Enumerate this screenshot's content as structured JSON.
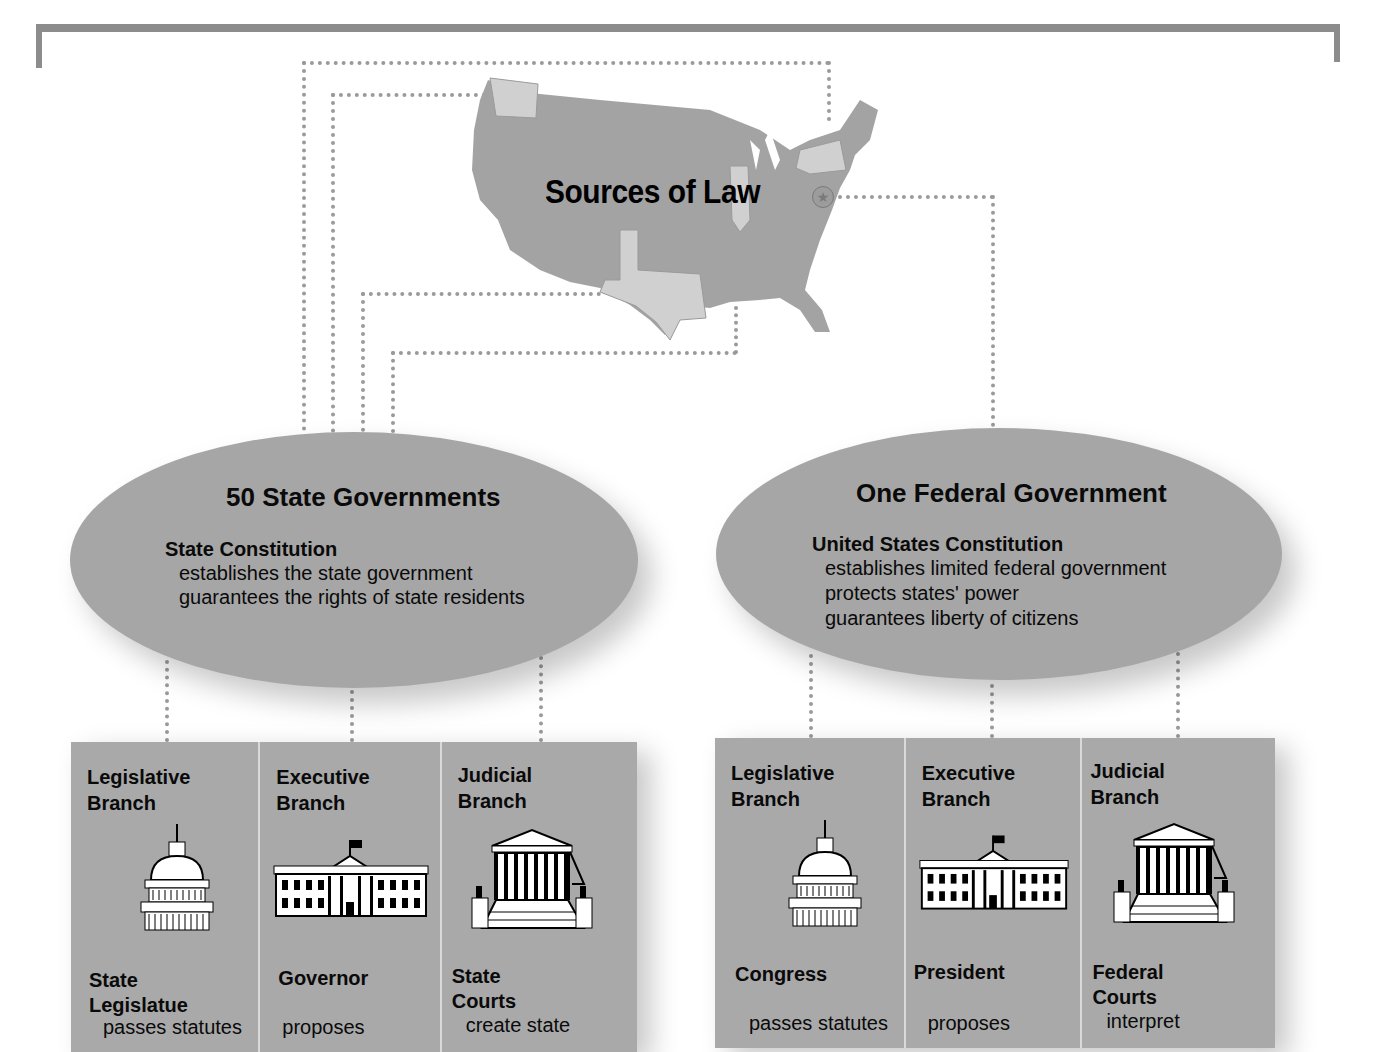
{
  "diagram": {
    "title": "Sources of Law",
    "map_icon": "us-map-icon",
    "capital_marker_icon": "star-icon"
  },
  "state": {
    "title": "50 State Governments",
    "constitution": "State Constitution",
    "lines": [
      "establishes the state government",
      "guarantees the rights of state residents"
    ],
    "branches": [
      {
        "head": "Legislative\nBranch",
        "icon": "capitol-dome-icon",
        "body": "State\nLegislatue",
        "desc": "passes statutes"
      },
      {
        "head": "Executive\nBranch",
        "icon": "white-house-icon",
        "body": "Governor",
        "desc": "proposes"
      },
      {
        "head": "Judicial\nBranch",
        "icon": "supreme-court-icon",
        "body": "State\nCourts",
        "desc": "create state"
      }
    ]
  },
  "federal": {
    "title": "One Federal Government",
    "constitution": "United States Constitution",
    "lines": [
      "establishes limited federal government",
      "protects states' power",
      "guarantees liberty of citizens"
    ],
    "branches": [
      {
        "head": "Legislative\nBranch",
        "icon": "capitol-dome-icon",
        "body": "Congress",
        "desc": "passes statutes"
      },
      {
        "head": "Executive\nBranch",
        "icon": "white-house-icon",
        "body": "President",
        "desc": "proposes"
      },
      {
        "head": "Judicial\nBranch",
        "icon": "supreme-court-icon",
        "body": "Federal\nCourts",
        "desc": "interpret"
      }
    ]
  },
  "colors": {
    "frame": "#8c8c8c",
    "ellipse": "#a6a6a6",
    "panel": "#a9a9a9",
    "map": "#a3a3a3",
    "highlight_state": "#d0d0d0",
    "dots": "#9a9a9a"
  }
}
